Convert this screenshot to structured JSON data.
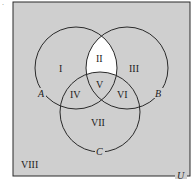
{
  "diagram": {
    "type": "venn-3-set",
    "universe_label": "U",
    "set_labels": {
      "A": "A",
      "B": "B",
      "C": "C"
    },
    "regions": {
      "I": "I",
      "II": "II",
      "III": "III",
      "IV": "IV",
      "V": "V",
      "VI": "VI",
      "VII": "VII",
      "VIII": "VIII"
    },
    "highlighted_region": "II",
    "colors": {
      "background": "#cfcfcf",
      "highlight": "#ffffff",
      "stroke": "#2a2a2a"
    }
  }
}
